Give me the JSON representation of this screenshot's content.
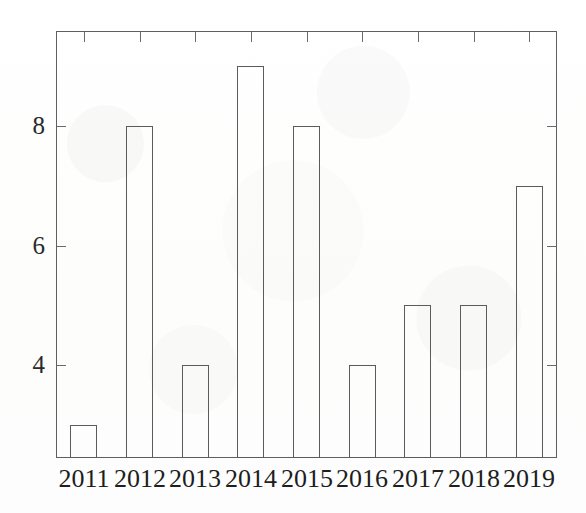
{
  "chart_data": {
    "type": "bar",
    "title": "",
    "subtitle": "",
    "xlabel": "",
    "ylabel": "",
    "categories": [
      "2011",
      "2012",
      "2013",
      "2014",
      "2015",
      "2016",
      "2017",
      "2018",
      "2019"
    ],
    "values": [
      3,
      8,
      4,
      9,
      8,
      4,
      5,
      5,
      7
    ],
    "series": [
      {
        "name": "count",
        "values": [
          3,
          8,
          4,
          9,
          8,
          4,
          5,
          5,
          7
        ]
      }
    ],
    "y_tick_labels": [
      "4",
      "6",
      "8"
    ],
    "y_tick_values": [
      4,
      6,
      8
    ],
    "ylim": [
      2.5,
      9.45
    ],
    "xlim": [
      "2010.6",
      "2019.6"
    ],
    "grid": false,
    "legend": null,
    "legend_position": "none",
    "bar_style": "unfilled-outline",
    "annotations": [],
    "colors": {
      "bar_fill": "#ffffff",
      "bar_outline": "#5b5b5b",
      "axis": "#5f5f5f",
      "text": "#1e1e1e",
      "background": "#fefefe"
    }
  },
  "axis": {
    "y_ticks": [
      {
        "label": "8",
        "value": 8
      },
      {
        "label": "6",
        "value": 6
      },
      {
        "label": "4",
        "value": 4
      }
    ],
    "x_ticks": [
      {
        "label": "2011"
      },
      {
        "label": "2012"
      },
      {
        "label": "2013"
      },
      {
        "label": "2014"
      },
      {
        "label": "2015"
      },
      {
        "label": "2016"
      },
      {
        "label": "2017"
      },
      {
        "label": "2018"
      },
      {
        "label": "2019"
      }
    ]
  }
}
